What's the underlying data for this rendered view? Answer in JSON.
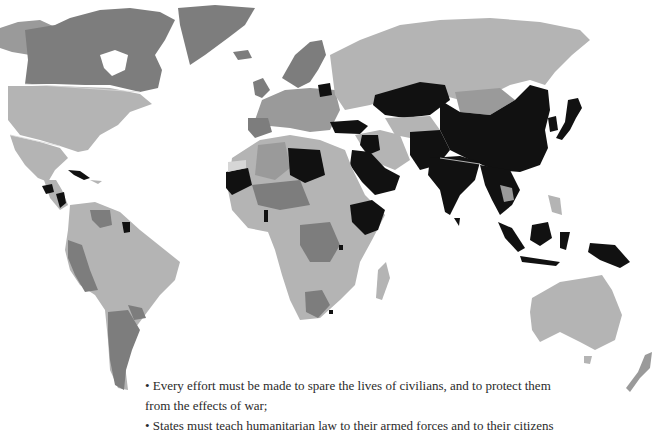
{
  "map": {
    "title": "World map showing countries by status",
    "color_scale": {
      "black": "#111111",
      "dark_grey": "#7d7d7d",
      "medium_grey": "#9a9a9a",
      "light_grey": "#b4b4b4"
    },
    "highlighted_regions_black": [
      "Libya",
      "Mauritania",
      "Saudi Arabia",
      "Iraq",
      "Turkey",
      "Ethiopia",
      "Somalia",
      "Kazakhstan",
      "China",
      "India",
      "Pakistan",
      "Afghanistan",
      "Myanmar",
      "Thailand",
      "Malaysia",
      "Indonesia",
      "Papua New Guinea",
      "Japan",
      "Guatemala",
      "Nicaragua",
      "Cuba",
      "Suriname",
      "Belarus",
      "Sri Lanka",
      "Iran-border region"
    ]
  },
  "caption": {
    "lines": [
      "• Every effort must be made to spare the lives of civilians, and to protect them",
      "from the effects of war;",
      "• States must teach humanitarian law to their armed forces and to their citizens"
    ]
  }
}
